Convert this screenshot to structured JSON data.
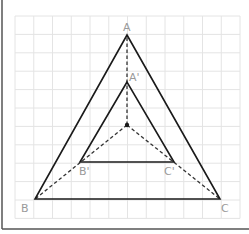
{
  "figure": {
    "type": "homothety-diagram",
    "grid": {
      "x0": 15,
      "y0": 16,
      "cols": 12,
      "rows": 11,
      "cell_w": 18.75,
      "cell_h": 18.4,
      "color": "#e4e4e4"
    },
    "frame": {
      "color": "#555555"
    },
    "center": {
      "x": 127,
      "y": 125,
      "label": ""
    },
    "outer_triangle": {
      "A": {
        "x": 127,
        "y": 35,
        "label": "A"
      },
      "B": {
        "x": 35,
        "y": 199,
        "label": "B"
      },
      "C": {
        "x": 220,
        "y": 199,
        "label": "C"
      }
    },
    "inner_triangle": {
      "A": {
        "x": 127,
        "y": 82,
        "label": "A'"
      },
      "B": {
        "x": 80,
        "y": 162,
        "label": "B'"
      },
      "C": {
        "x": 174,
        "y": 162,
        "label": "C'"
      }
    },
    "line_color": "#1a1a1a",
    "label_color": "#9a9a9a"
  }
}
